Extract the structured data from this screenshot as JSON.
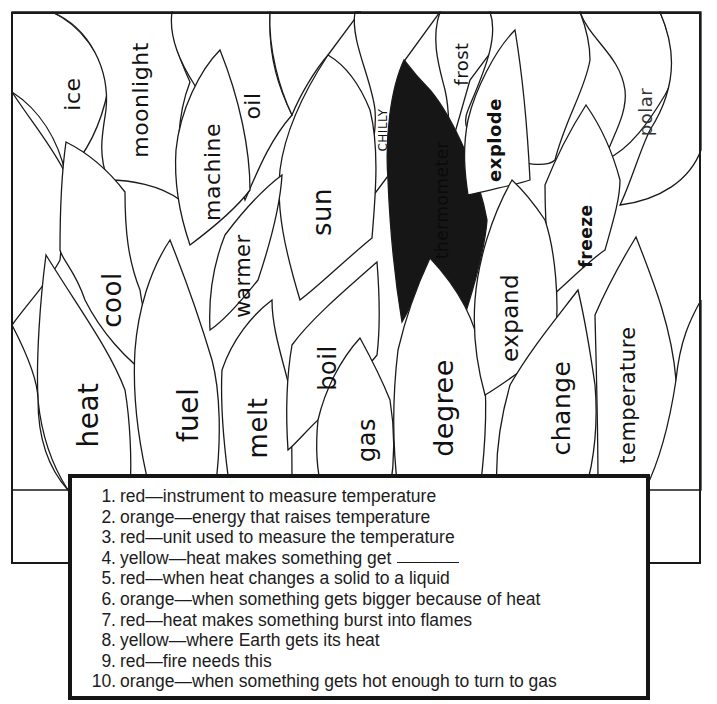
{
  "worksheet": {
    "type": "color-by-clue flame puzzle",
    "flame_words": [
      {
        "id": "ice",
        "text": "ice"
      },
      {
        "id": "moonlight",
        "text": "moonlight"
      },
      {
        "id": "machine",
        "text": "machine"
      },
      {
        "id": "oil",
        "text": "oil"
      },
      {
        "id": "sun",
        "text": "sun"
      },
      {
        "id": "chilly",
        "text": "CHILLY"
      },
      {
        "id": "thermometer",
        "text": "thermometer"
      },
      {
        "id": "frost",
        "text": "frost"
      },
      {
        "id": "explode",
        "text": "explode"
      },
      {
        "id": "polar",
        "text": "polar"
      },
      {
        "id": "cool",
        "text": "cool"
      },
      {
        "id": "warmer",
        "text": "warmer"
      },
      {
        "id": "freeze",
        "text": "freeze"
      },
      {
        "id": "heat",
        "text": "heat"
      },
      {
        "id": "fuel",
        "text": "fuel"
      },
      {
        "id": "melt",
        "text": "melt"
      },
      {
        "id": "boil",
        "text": "boil"
      },
      {
        "id": "gas",
        "text": "gas"
      },
      {
        "id": "degree",
        "text": "degree"
      },
      {
        "id": "expand",
        "text": "expand"
      },
      {
        "id": "change",
        "text": "change"
      },
      {
        "id": "temperature",
        "text": "temperature"
      }
    ],
    "colored_flame": {
      "word": "thermometer",
      "fill": "#161616"
    },
    "clues": [
      {
        "num": "1.",
        "color": "red",
        "text": "red—instrument to measure temperature"
      },
      {
        "num": "2.",
        "color": "orange",
        "text": "orange—energy that raises temperature"
      },
      {
        "num": "3.",
        "color": "red",
        "text": "red—unit used to measure the temperature"
      },
      {
        "num": "4.",
        "color": "yellow",
        "text": "yellow—heat makes something get",
        "has_blank": true
      },
      {
        "num": "5.",
        "color": "red",
        "text": "red—when heat changes a solid to a liquid"
      },
      {
        "num": "6.",
        "color": "orange",
        "text": "orange—when something gets bigger because of heat"
      },
      {
        "num": "7.",
        "color": "red",
        "text": "red—heat makes something burst into flames"
      },
      {
        "num": "8.",
        "color": "yellow",
        "text": "yellow—where Earth gets its heat"
      },
      {
        "num": "9.",
        "color": "red",
        "text": "red—fire needs this"
      },
      {
        "num": "10.",
        "color": "orange",
        "text": "orange—when something gets hot enough to turn to gas"
      }
    ]
  }
}
